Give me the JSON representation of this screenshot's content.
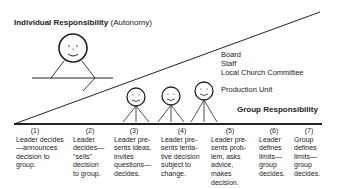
{
  "title": {
    "bold": "Individual Responsibility",
    "normal": "(Autonomy)"
  },
  "levels": [
    "Board",
    "Staff",
    "Local Church Committee"
  ],
  "production_unit": "Production Unit",
  "group_label": "Group Responsibility",
  "columns": [
    {
      "num": "(1)",
      "text": "Leader decides\n—announces\ndecision to\ngroup."
    },
    {
      "num": "(2)",
      "text": "Leader\ndecides—\n\"sells\"\ndecision\nto group."
    },
    {
      "num": "(3)",
      "text": "Leader pre-\nsents ideas,\ninvites\nquestions—\ndecides."
    },
    {
      "num": "(4)",
      "text": "Leader pre-\nsents tenta-\ntive decision\nsubject to\nchange."
    },
    {
      "num": "(5)",
      "text": "Leader pre-\nsents prob-\nlem, asks\nadvice,\nmakes\ndecision."
    },
    {
      "num": "(6)",
      "text": "Leader\ndefines\nlimits—\ngroup\ndecides."
    },
    {
      "num": "(7)",
      "text": "Group\ndefines\nlimits—\ngroup\ndecides."
    }
  ],
  "colors": {
    "ink": "#222222",
    "background": "#ffffff"
  }
}
